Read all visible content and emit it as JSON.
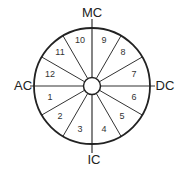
{
  "diagram": {
    "type": "house-wheel",
    "center": [
      92,
      86
    ],
    "outer_radius": 58,
    "inner_radius": 8.5,
    "stroke_color": "#222222",
    "spoke_color": "#333333",
    "background": "#ffffff"
  },
  "angles": [
    {
      "name": "MC",
      "label": "MC",
      "x": 92,
      "y": 17
    },
    {
      "name": "IC",
      "label": "IC",
      "x": 94,
      "y": 164
    },
    {
      "name": "AC",
      "label": "AC",
      "x": 23,
      "y": 90
    },
    {
      "name": "DC",
      "label": "DC",
      "x": 165,
      "y": 90
    }
  ],
  "houses": [
    {
      "number": "1",
      "x": 50,
      "y": 100
    },
    {
      "number": "2",
      "x": 60,
      "y": 119
    },
    {
      "number": "3",
      "x": 80,
      "y": 132
    },
    {
      "number": "4",
      "x": 104,
      "y": 132
    },
    {
      "number": "5",
      "x": 122,
      "y": 119
    },
    {
      "number": "6",
      "x": 134,
      "y": 100
    },
    {
      "number": "7",
      "x": 134,
      "y": 77
    },
    {
      "number": "8",
      "x": 123,
      "y": 55
    },
    {
      "number": "9",
      "x": 104,
      "y": 43
    },
    {
      "number": "10",
      "x": 80,
      "y": 43
    },
    {
      "number": "11",
      "x": 60,
      "y": 55
    },
    {
      "number": "12",
      "x": 50,
      "y": 77
    }
  ]
}
